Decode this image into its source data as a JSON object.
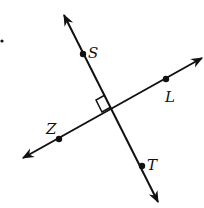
{
  "diagram": {
    "type": "perpendicular-lines",
    "colors": {
      "stroke": "#111111",
      "background": "#ffffff"
    },
    "lines": [
      {
        "name": "line-ST",
        "from": [
          64,
          15
        ],
        "to": [
          158,
          202
        ],
        "points": [
          "S",
          "T"
        ]
      },
      {
        "name": "line-ZL",
        "from": [
          23,
          158
        ],
        "to": [
          202,
          58
        ],
        "points": [
          "Z",
          "L"
        ]
      }
    ],
    "points": [
      {
        "label": "S",
        "x": 83,
        "y": 54,
        "label_x": 88,
        "label_y": 58
      },
      {
        "label": "L",
        "x": 166,
        "y": 79,
        "label_x": 165,
        "label_y": 102
      },
      {
        "label": "Z",
        "x": 59,
        "y": 139,
        "label_x": 47,
        "label_y": 133
      },
      {
        "label": "T",
        "x": 142,
        "y": 166,
        "label_x": 147,
        "label_y": 170
      }
    ],
    "intersection": {
      "x": 112,
      "y": 108
    },
    "right_angle_marker": true,
    "stray_dot": {
      "x": 2,
      "y": 41
    }
  },
  "labels": {
    "S": "S",
    "L": "L",
    "Z": "Z",
    "T": "T"
  }
}
